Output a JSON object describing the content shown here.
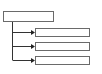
{
  "diagram": {
    "type": "tree",
    "line_color": "#333333",
    "border_color": "#6a6a6a",
    "root": {
      "label": ""
    },
    "children": [
      {
        "label": ""
      },
      {
        "label": ""
      },
      {
        "label": ""
      }
    ]
  }
}
